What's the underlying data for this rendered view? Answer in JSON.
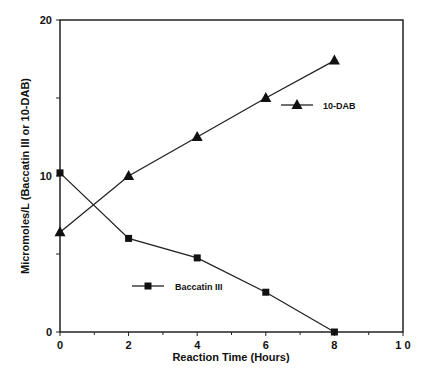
{
  "chart_data": {
    "type": "line",
    "title": "",
    "xlabel": "Reaction Time (Hours)",
    "ylabel": "Micromoles/L (Baccatin III or 10-DAB)",
    "xlim": [
      0,
      10
    ],
    "ylim": [
      0,
      20
    ],
    "x_ticks": [
      "0",
      "2",
      "4",
      "6",
      "8",
      "10"
    ],
    "y_ticks": [
      "0",
      "10",
      "20"
    ],
    "grid": false,
    "x": [
      0,
      2,
      4,
      6,
      8
    ],
    "series": [
      {
        "name": "10-DAB",
        "marker": "triangle",
        "values": [
          6.4,
          10.0,
          12.5,
          15.0,
          17.4
        ]
      },
      {
        "name": "Baccatin III",
        "marker": "square",
        "values": [
          10.2,
          6.0,
          4.75,
          2.55,
          0.0
        ]
      }
    ],
    "legend": [
      {
        "label": "10-DAB",
        "marker": "triangle",
        "position": "upper right inside plot"
      },
      {
        "label": "Baccatin III",
        "marker": "square",
        "position": "lower middle inside plot"
      }
    ]
  }
}
